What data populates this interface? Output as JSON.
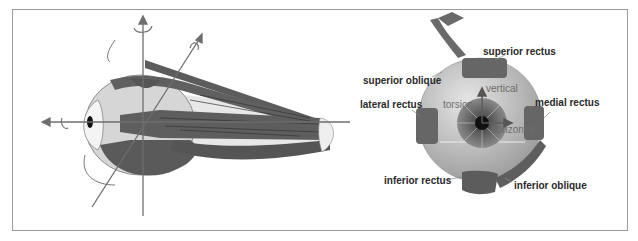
{
  "figure": {
    "left_panel": {
      "description": "side view of eyeball with extraocular muscles and rotation axes",
      "muscle_color": "#5a5a5a",
      "globe_color": "#d6d6d6",
      "axis_color": "#6e6e6e"
    },
    "right_panel": {
      "labels": {
        "superior_rectus": "superior rectus",
        "superior_oblique": "superior oblique",
        "lateral_rectus": "lateral rectus",
        "medial_rectus": "medial rectus",
        "inferior_rectus": "inferior rectus",
        "inferior_oblique": "inferior oblique"
      },
      "axis_labels": {
        "vertical": "vertical",
        "torsion": "torsion",
        "horizontal": "horizontal"
      },
      "label_color": "#2a2a2a",
      "axis_label_color": "#707070"
    },
    "frame_color": "#9a9a9a"
  }
}
